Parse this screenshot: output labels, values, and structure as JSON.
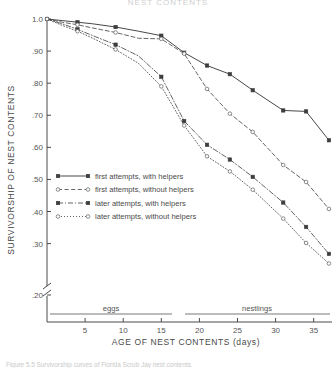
{
  "figure": {
    "title": "NEST CONTENTS",
    "caption": "Figure 5.5  Survivorship curves of Florida Scrub Jay nest contents."
  },
  "chart_data": {
    "type": "line",
    "title": "NEST CONTENTS",
    "xlabel": "AGE OF NEST CONTENTS (days)",
    "ylabel": "SURVIVORSHIP OF NEST CONTENTS",
    "xlim": [
      0,
      37
    ],
    "ylim": [
      0.2,
      1.0
    ],
    "y_axis_break": true,
    "y_break_between": [
      0.3,
      0.2
    ],
    "grid": false,
    "legend_position": "center-left",
    "xticks": [
      5,
      10,
      15,
      20,
      25,
      30,
      35
    ],
    "xtick_labels": [
      "5",
      "10",
      "15",
      "20",
      "25",
      "30",
      "35"
    ],
    "yticks": [
      1.0,
      0.9,
      0.8,
      0.7,
      0.6,
      0.5,
      0.4,
      0.3,
      0.2
    ],
    "ytick_labels": [
      "1.0",
      ".90",
      ".80",
      ".70",
      ".60",
      ".50",
      ".40",
      ".30",
      ".20"
    ],
    "annotations": [
      {
        "text": "eggs",
        "x_range": [
          1,
          17
        ]
      },
      {
        "text": "nestlings",
        "x_range": [
          19,
          37
        ]
      }
    ],
    "series": [
      {
        "name": "first attempts, with helpers",
        "marker": "filled-square",
        "linestyle": "solid",
        "x": [
          0,
          2,
          4,
          6,
          9,
          12,
          15,
          18,
          21,
          24,
          27,
          31,
          34,
          37
        ],
        "y": [
          1.0,
          0.995,
          0.99,
          0.985,
          0.975,
          0.962,
          0.948,
          0.895,
          0.855,
          0.828,
          0.778,
          0.715,
          0.712,
          0.622
        ]
      },
      {
        "name": "first attempts, without helpers",
        "marker": "open-circle",
        "linestyle": "dashed",
        "x": [
          0,
          2,
          4,
          6,
          9,
          12,
          15,
          18,
          21,
          24,
          27,
          31,
          34,
          37
        ],
        "y": [
          1.0,
          0.99,
          0.982,
          0.972,
          0.958,
          0.94,
          0.938,
          0.892,
          0.782,
          0.705,
          0.648,
          0.545,
          0.492,
          0.408
        ]
      },
      {
        "name": "later attempts, with helpers",
        "marker": "filled-square",
        "linestyle": "dash-dot",
        "x": [
          0,
          2,
          4,
          6,
          9,
          12,
          15,
          18,
          21,
          24,
          27,
          31,
          34,
          37
        ],
        "y": [
          1.0,
          0.985,
          0.968,
          0.948,
          0.92,
          0.885,
          0.82,
          0.682,
          0.608,
          0.562,
          0.508,
          0.428,
          0.352,
          0.268
        ]
      },
      {
        "name": "later attempts, without helpers",
        "marker": "open-circle",
        "linestyle": "dotted",
        "x": [
          0,
          2,
          4,
          6,
          9,
          12,
          15,
          18,
          21,
          24,
          27,
          31,
          34,
          37
        ],
        "y": [
          1.0,
          0.98,
          0.962,
          0.94,
          0.905,
          0.862,
          0.79,
          0.668,
          0.572,
          0.525,
          0.468,
          0.378,
          0.302,
          0.238
        ]
      }
    ]
  },
  "axes": {
    "y_title": "SURVIVORSHIP OF NEST CONTENTS",
    "x_title": "AGE OF NEST CONTENTS (days)",
    "y_labels": [
      "1.0",
      ".90",
      ".80",
      ".70",
      ".60",
      ".50",
      ".40",
      ".30",
      ".20"
    ],
    "x_labels": [
      "5",
      "10",
      "15",
      "20",
      "25",
      "30",
      "35"
    ]
  },
  "bands": {
    "eggs": "eggs",
    "nestlings": "nestlings"
  },
  "legend": {
    "items": [
      {
        "label": "first attempts, with helpers"
      },
      {
        "label": "first attempts, without helpers"
      },
      {
        "label": "later attempts, with helpers"
      },
      {
        "label": "later attempts, without helpers"
      }
    ]
  },
  "colors": {
    "ink": "#3d3d3d",
    "axis": "#4a4a4a",
    "open_marker_stroke": "#6f6f6f",
    "background": "#ffffff"
  }
}
